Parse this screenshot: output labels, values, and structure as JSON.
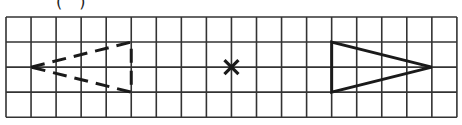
{
  "label": "( )",
  "grid": {
    "origin_x": 6,
    "origin_y": 17,
    "cell": 25.05,
    "cols": 18,
    "rows": 4,
    "line_color": "#333333"
  },
  "shapes": {
    "dashed_triangle": {
      "style": "dashed",
      "vertices_grid": [
        [
          1,
          2
        ],
        [
          5,
          1
        ],
        [
          5,
          3
        ]
      ]
    },
    "center_mark": {
      "symbol": "x",
      "position_grid": [
        9,
        2
      ]
    },
    "solid_triangle": {
      "style": "solid",
      "vertices_grid": [
        [
          13,
          1
        ],
        [
          13,
          3
        ],
        [
          17,
          2
        ]
      ]
    }
  }
}
